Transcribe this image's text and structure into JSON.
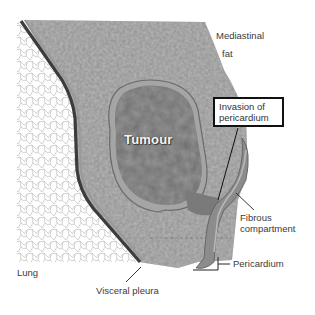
{
  "diagram": {
    "type": "anatomical-illustration",
    "colors": {
      "background": "#ffffff",
      "lung_texture": "#c8c8c8",
      "mediastinal_fat": "#8e8e8e",
      "tumour": "#6a6a6a",
      "tumour_capsule": "#a6a6a6",
      "pleura_dark": "#3c3c3c",
      "pericardium": "#909090",
      "callout_border": "#111111",
      "tumour_label": "#f4f4f4"
    }
  },
  "labels": {
    "mediastinal_fat_line1": "Mediastinal",
    "mediastinal_fat_line2": "fat",
    "tumour": "Tumour",
    "invasion_line1": "Invasion of",
    "invasion_line2": "pericardium",
    "fibrous_line1": "Fibrous",
    "fibrous_line2": "compartment",
    "pericardium": "Pericardium",
    "lung": "Lung",
    "visceral_pleura": "Visceral pleura"
  }
}
